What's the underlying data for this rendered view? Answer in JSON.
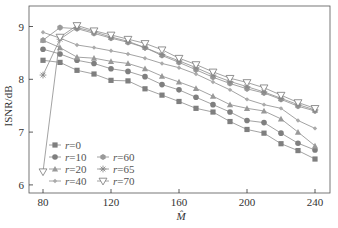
{
  "chart_data": {
    "type": "line",
    "title": "",
    "xlabel": "M̂",
    "ylabel": "ISNR/dB",
    "xlim": [
      75,
      245
    ],
    "ylim": [
      5.85,
      9.4
    ],
    "xticks": [
      80,
      120,
      160,
      200,
      240
    ],
    "yticks": [
      6,
      7,
      8,
      9
    ],
    "grid": false,
    "legend_position": "lower left (inside), 2 columns",
    "x": [
      80,
      90,
      100,
      110,
      120,
      130,
      140,
      150,
      160,
      170,
      180,
      190,
      200,
      210,
      220,
      230,
      240
    ],
    "series": [
      {
        "name": "r=0",
        "marker": "square",
        "values": [
          8.36,
          8.32,
          8.17,
          8.1,
          7.98,
          7.97,
          7.82,
          7.7,
          7.58,
          7.45,
          7.38,
          7.2,
          7.05,
          6.98,
          6.78,
          6.65,
          6.49
        ]
      },
      {
        "name": "r=10",
        "marker": "circle",
        "values": [
          8.57,
          8.48,
          8.36,
          8.3,
          8.2,
          8.15,
          8.05,
          7.9,
          7.8,
          7.66,
          7.52,
          7.38,
          7.22,
          7.18,
          6.98,
          6.79,
          6.66
        ]
      },
      {
        "name": "r=20",
        "marker": "triangle-up",
        "values": [
          8.74,
          8.6,
          8.42,
          8.4,
          8.34,
          8.3,
          8.2,
          8.06,
          7.95,
          7.83,
          7.68,
          7.52,
          7.45,
          7.4,
          7.25,
          7.0,
          6.74
        ]
      },
      {
        "name": "r=40",
        "marker": "diamond",
        "values": [
          8.89,
          8.78,
          8.65,
          8.6,
          8.54,
          8.48,
          8.4,
          8.3,
          8.22,
          8.1,
          7.95,
          7.8,
          7.62,
          7.52,
          7.45,
          7.22,
          7.07
        ]
      },
      {
        "name": "r=60",
        "marker": "hexagon",
        "values": [
          8.74,
          8.98,
          8.96,
          8.87,
          8.78,
          8.7,
          8.6,
          8.45,
          8.32,
          8.18,
          8.04,
          7.92,
          7.82,
          7.74,
          7.62,
          7.49,
          7.4
        ]
      },
      {
        "name": "r=65",
        "marker": "star",
        "values": [
          8.08,
          8.76,
          8.98,
          8.9,
          8.8,
          8.72,
          8.6,
          8.47,
          8.35,
          8.22,
          8.08,
          7.96,
          7.86,
          7.76,
          7.64,
          7.52,
          7.42
        ]
      },
      {
        "name": "r=70",
        "marker": "triangle-down",
        "values": [
          6.25,
          8.8,
          9.02,
          8.92,
          8.84,
          8.76,
          8.68,
          8.56,
          8.4,
          8.28,
          8.14,
          8.02,
          7.94,
          7.84,
          7.7,
          7.56,
          7.45
        ]
      }
    ]
  },
  "axes": {
    "xlabel": "M̂",
    "ylabel": "ISNR/dB",
    "xticks": [
      "80",
      "120",
      "160",
      "200",
      "240"
    ],
    "yticks": [
      "6",
      "7",
      "8",
      "9"
    ]
  },
  "legend": {
    "items": [
      {
        "label_var": "r",
        "label_val": "=0"
      },
      {
        "label_var": "r",
        "label_val": "=10"
      },
      {
        "label_var": "r",
        "label_val": "=20"
      },
      {
        "label_var": "r",
        "label_val": "=40"
      },
      {
        "label_var": "r",
        "label_val": "=60"
      },
      {
        "label_var": "r",
        "label_val": "=65"
      },
      {
        "label_var": "r",
        "label_val": "=70"
      }
    ]
  },
  "colors": {
    "line": "#8c8c8c",
    "marker": "#7f7f7f",
    "axis": "#333333",
    "frame": "#555555"
  }
}
